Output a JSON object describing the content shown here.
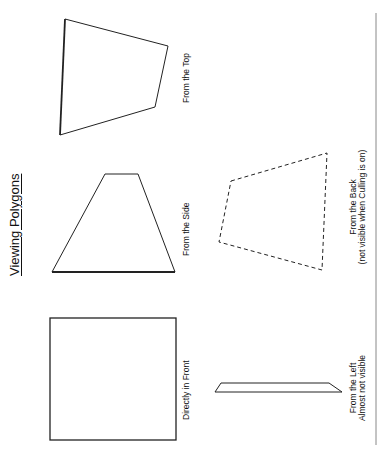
{
  "title": "Viewing Polygons",
  "views": {
    "top": {
      "label": "From the Top"
    },
    "side": {
      "label": "From the Side"
    },
    "front": {
      "label": "Directly in Front"
    },
    "back": {
      "label": "From the Back",
      "note": "(not visible when Culling is on)"
    },
    "left": {
      "label": "From the Left",
      "note": "Almost not visible"
    }
  },
  "colors": {
    "stroke": "#222222",
    "background": "#ffffff"
  }
}
